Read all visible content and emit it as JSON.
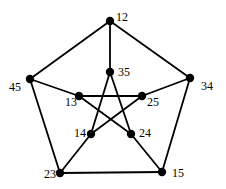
{
  "diagram": {
    "type": "graph",
    "name": "Petersen graph",
    "colors": {
      "edge": "#000000",
      "node": "#000000",
      "label": "#000000",
      "background": "#ffffff"
    },
    "nodes": [
      {
        "id": "12",
        "label": "12",
        "x": 110,
        "y": 21,
        "lx": 116,
        "ly": 21
      },
      {
        "id": "34",
        "label": "34",
        "x": 190,
        "y": 78,
        "lx": 201,
        "ly": 90
      },
      {
        "id": "15",
        "label": "15",
        "x": 162,
        "y": 172,
        "lx": 172,
        "ly": 177
      },
      {
        "id": "23",
        "label": "23",
        "x": 60,
        "y": 173,
        "lx": 44,
        "ly": 178
      },
      {
        "id": "45",
        "label": "45",
        "x": 30,
        "y": 79,
        "lx": 9,
        "ly": 91
      },
      {
        "id": "35",
        "label": "35",
        "x": 110,
        "y": 72,
        "lx": 118,
        "ly": 76
      },
      {
        "id": "25",
        "label": "25",
        "x": 142,
        "y": 96,
        "lx": 147,
        "ly": 106
      },
      {
        "id": "24",
        "label": "24",
        "x": 131,
        "y": 134,
        "lx": 139,
        "ly": 137
      },
      {
        "id": "14",
        "label": "14",
        "x": 91,
        "y": 134,
        "lx": 74,
        "ly": 137
      },
      {
        "id": "13",
        "label": "13",
        "x": 79,
        "y": 96,
        "lx": 65,
        "ly": 106
      }
    ],
    "edges": [
      [
        "12",
        "34"
      ],
      [
        "34",
        "15"
      ],
      [
        "15",
        "23"
      ],
      [
        "23",
        "45"
      ],
      [
        "45",
        "12"
      ],
      [
        "12",
        "35"
      ],
      [
        "34",
        "25"
      ],
      [
        "15",
        "24"
      ],
      [
        "23",
        "14"
      ],
      [
        "45",
        "13"
      ],
      [
        "35",
        "14"
      ],
      [
        "35",
        "24"
      ],
      [
        "13",
        "25"
      ],
      [
        "13",
        "24"
      ],
      [
        "14",
        "25"
      ]
    ]
  }
}
